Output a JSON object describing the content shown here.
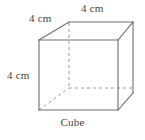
{
  "figure": {
    "name": "cube-diagram",
    "caption": "Cube",
    "shape_type": "cube",
    "unit": "cm",
    "edge_length": 4,
    "labels": {
      "depth": "4 cm",
      "width": "4 cm",
      "height": "4 cm"
    },
    "colors": {
      "background": "#ffffff",
      "visible_edge": "#6e6e6e",
      "hidden_edge": "#9a9a9a",
      "text": "#3f3f3f"
    },
    "geometry": {
      "front_top_left": [
        39,
        40
      ],
      "front_top_right": [
        118,
        40
      ],
      "front_bottom_left": [
        39,
        110
      ],
      "front_bottom_right": [
        118,
        110
      ],
      "back_top_left": [
        69,
        22
      ],
      "back_top_right": [
        133,
        22
      ],
      "back_bottom_left": [
        69,
        88
      ],
      "back_bottom_right": [
        133,
        93
      ]
    },
    "edges": {
      "visible": [
        "front-top",
        "front-right",
        "front-bottom",
        "front-left",
        "top-back",
        "back-right-vertical",
        "top-left-diagonal",
        "top-right-diagonal",
        "bottom-right-diagonal"
      ],
      "hidden": [
        "back-left-vertical",
        "back-bottom",
        "bottom-left-diagonal"
      ]
    }
  }
}
